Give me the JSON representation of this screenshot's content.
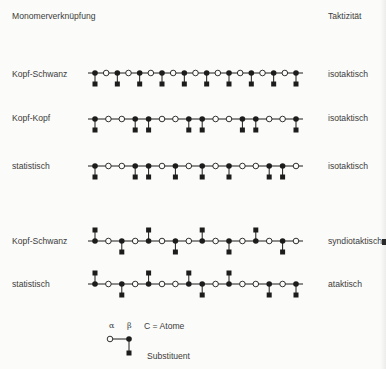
{
  "header": {
    "left_title": "Monomerverknüpfung",
    "right_title": "Taktizität"
  },
  "rows": [
    {
      "linkage": "Kopf-Schwanz",
      "tacticity": "isotaktisch",
      "atoms": [
        "F",
        "O",
        "F",
        "O",
        "F",
        "O",
        "F",
        "O",
        "F",
        "O",
        "F",
        "O",
        "F",
        "O",
        "F",
        "O",
        "F",
        "O",
        "F"
      ],
      "substituents": [
        "d",
        "",
        "d",
        "",
        "d",
        "",
        "d",
        "",
        "d",
        "",
        "d",
        "",
        "d",
        "",
        "d",
        "",
        "d",
        "",
        "d"
      ]
    },
    {
      "linkage": "Kopf-Kopf",
      "tacticity": "isotaktisch",
      "atoms": [
        "F",
        "O",
        "O",
        "F",
        "F",
        "O",
        "O",
        "F",
        "F",
        "O",
        "O",
        "F",
        "F",
        "O",
        "O",
        "F"
      ],
      "substituents": [
        "d",
        "",
        "",
        "d",
        "d",
        "",
        "",
        "d",
        "d",
        "",
        "",
        "d",
        "d",
        "",
        "",
        "d"
      ]
    },
    {
      "linkage": "statistisch",
      "tacticity": "isotaktisch",
      "atoms": [
        "F",
        "O",
        "O",
        "F",
        "F",
        "O",
        "F",
        "O",
        "F",
        "O",
        "F",
        "O",
        "O",
        "F",
        "F",
        "O"
      ],
      "substituents": [
        "d",
        "",
        "",
        "d",
        "d",
        "",
        "d",
        "",
        "d",
        "",
        "d",
        "",
        "",
        "d",
        "d",
        ""
      ]
    },
    {
      "linkage": "Kopf-Schwanz",
      "tacticity": "syndiotaktisch",
      "atoms": [
        "F",
        "O",
        "F",
        "O",
        "F",
        "O",
        "F",
        "O",
        "F",
        "O",
        "F",
        "O",
        "F",
        "O",
        "F",
        "O"
      ],
      "substituents": [
        "u",
        "",
        "d",
        "",
        "u",
        "",
        "d",
        "",
        "u",
        "",
        "d",
        "",
        "u",
        "",
        "d",
        ""
      ]
    },
    {
      "linkage": "statistisch",
      "tacticity": "ataktisch",
      "atoms": [
        "F",
        "O",
        "F",
        "O",
        "F",
        "O",
        "O",
        "F",
        "F",
        "O",
        "F",
        "O",
        "O",
        "F",
        "O",
        "F"
      ],
      "substituents": [
        "u",
        "",
        "d",
        "",
        "u",
        "",
        "",
        "u",
        "d",
        "",
        "u",
        "",
        "",
        "d",
        "",
        "d"
      ]
    }
  ],
  "legend": {
    "alpha": "α",
    "beta": "β",
    "atoms_label": "C = Atome",
    "substituent_label": "Substituent"
  }
}
